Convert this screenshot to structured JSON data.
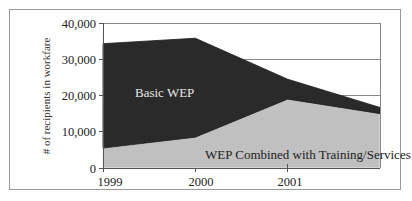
{
  "chart_data": {
    "type": "area",
    "stacked": true,
    "title": "",
    "xlabel": "",
    "ylabel": "# of recipients in workfare",
    "categories": [
      "1999",
      "2000",
      "2001",
      "2002"
    ],
    "x_tick_labels": [
      "1999",
      "2000",
      "2001"
    ],
    "y_ticks": [
      "0",
      "10,000",
      "20,000",
      "30,000",
      "40,000"
    ],
    "ylim": [
      0,
      40000
    ],
    "grid": true,
    "legend": "inline labels",
    "series": [
      {
        "name": "WEP Combined with Training/Services",
        "values": [
          5500,
          8500,
          19000,
          15000
        ],
        "color": "#c0c0c0"
      },
      {
        "name": "Basic WEP",
        "values": [
          28800,
          27300,
          5500,
          1700
        ],
        "color": "#2a2a2a"
      }
    ],
    "totals": [
      34300,
      35800,
      24500,
      16700
    ]
  },
  "labels": {
    "basic": "Basic WEP",
    "combined": "WEP Combined with Training/Services"
  }
}
